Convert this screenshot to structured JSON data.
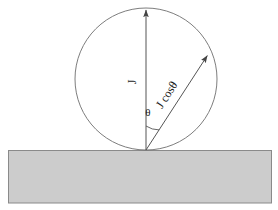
{
  "figure": {
    "background_color": "#ffffff"
  },
  "canvas": {
    "width": 278,
    "height": 210
  },
  "slab": {
    "name": "surface-slab",
    "x": 8,
    "y": 150,
    "width": 264,
    "height": 53,
    "fill_color": "#cccccc",
    "stroke_color": "#8a8a8a"
  },
  "circle": {
    "name": "source-circle",
    "center_x": 146,
    "center_y": 79,
    "radius": 71,
    "stroke_color": "#6e6e6e",
    "fill_color": "none"
  },
  "origin": {
    "x": 146,
    "y": 150
  },
  "vectors": [
    {
      "id": "vertical",
      "label": "J",
      "x1": 146,
      "y1": 150,
      "x2": 146,
      "y2": 8,
      "angle_from_vertical_deg": 0,
      "label_x": 136,
      "label_y": 82,
      "label_rotation_deg": -90,
      "stroke_color": "#555555"
    },
    {
      "id": "inclined",
      "label": "J cosθ",
      "x1": 146,
      "y1": 150,
      "x2": 209,
      "y2": 53,
      "angle_from_vertical_deg": 33,
      "label_x": 170,
      "label_y": 97,
      "label_rotation_deg": -57,
      "stroke_color": "#555555"
    }
  ],
  "angle_marker": {
    "name": "theta-angle",
    "symbol": "θ",
    "label_x": 144,
    "label_y": 116,
    "arc_radius": 24,
    "stroke_color": "#555555"
  },
  "colors": {
    "line": "#6e6e6e",
    "vector": "#555555",
    "slab_fill": "#cccccc",
    "slab_stroke": "#8a8a8a",
    "text": "#1a1a1a"
  }
}
